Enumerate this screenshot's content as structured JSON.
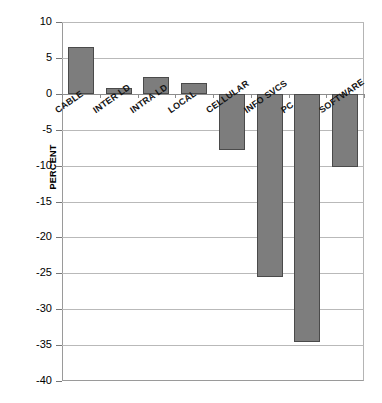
{
  "chart_data": {
    "type": "bar",
    "title": "",
    "xlabel": "",
    "ylabel": "PERCENT",
    "categories": [
      "CABLE",
      "INTER LD",
      "INTRA LD",
      "LOCAL",
      "CELLULAR",
      "INFO SVCS",
      "PC",
      "SOFTWARE"
    ],
    "values": [
      6.5,
      0.8,
      2.4,
      1.5,
      -7.8,
      -25.5,
      -34.5,
      -10.2
    ],
    "ylim": [
      -40,
      10
    ],
    "ytick_labels": [
      "10",
      "5",
      "0",
      "-5",
      "-10",
      "-15",
      "-20",
      "-25",
      "-30",
      "-35",
      "-40"
    ],
    "ytick_values": [
      10,
      5,
      0,
      -5,
      -10,
      -15,
      -20,
      -25,
      -30,
      -35,
      -40
    ],
    "grid": true,
    "legend": "none",
    "bar_color": "#7d7d7d",
    "bar_border_color": "#4a4a4a",
    "gridline_color": "#b9b9b9",
    "axis_color": "#9a9a9a"
  }
}
